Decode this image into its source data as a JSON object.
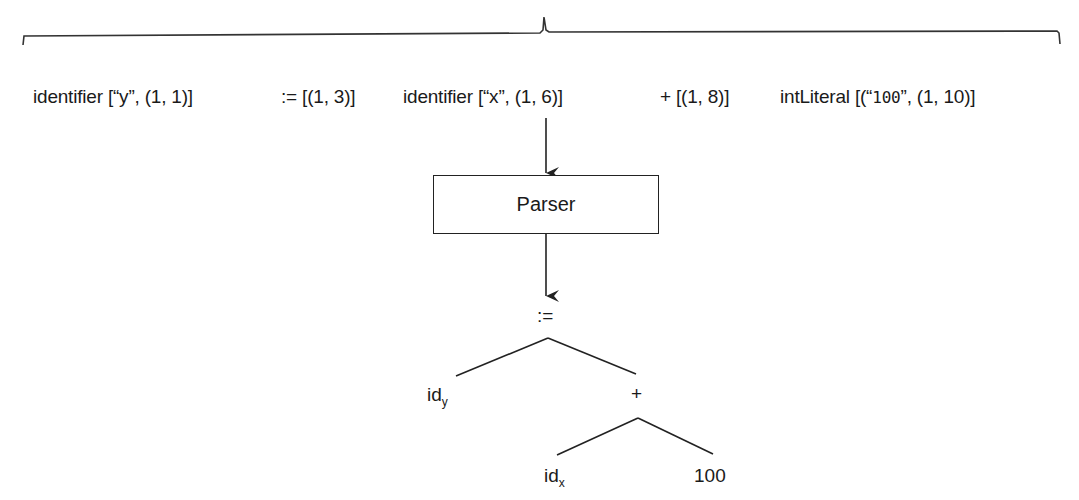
{
  "tokens": [
    {
      "kind": "identifier",
      "prefix": "identifier [“",
      "value": "y",
      "suffix": "”, (1, 1)]"
    },
    {
      "kind": "assign",
      "text": ":= [(1, 3)]"
    },
    {
      "kind": "identifier",
      "prefix": "identifier [“",
      "value": "x",
      "suffix": "”, (1, 6)]"
    },
    {
      "kind": "plus",
      "text": "+ [(1, 8)]"
    },
    {
      "kind": "intLiteral",
      "prefix": "intLiteral [(“",
      "value": "100",
      "suffix": "”, (1, 10)]"
    }
  ],
  "parser": {
    "label": "Parser"
  },
  "ast": {
    "root": ":=",
    "left": {
      "base": "id",
      "sub": "y"
    },
    "right": "+",
    "right_left": {
      "base": "id",
      "sub": "x"
    },
    "right_right": "100"
  },
  "colors": {
    "stroke": "#222222",
    "text": "#1a1a1a",
    "background": "#ffffff"
  }
}
